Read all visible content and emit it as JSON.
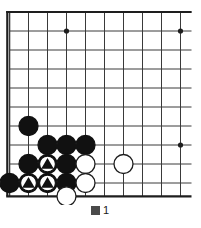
{
  "figure": {
    "caption": "圖 1",
    "caption_number": "1",
    "type": "go-board-diagram"
  },
  "board": {
    "columns": 10,
    "rows": 10,
    "grid_spacing": 19,
    "origin_x": 9.5,
    "origin_y": 12,
    "line_color": "#3a3a3a",
    "edge_color": "#1e1e1e",
    "background": "#ffffff",
    "edges": {
      "left": true,
      "top": true,
      "bottom": true,
      "right": false
    },
    "star_points": [
      {
        "col": 3,
        "row": 1
      },
      {
        "col": 9,
        "row": 1
      },
      {
        "col": 9,
        "row": 7
      }
    ],
    "stone_radius": 9.5,
    "colors": {
      "black_stone": "#111111",
      "white_stone": "#ffffff",
      "white_stone_border": "#1e1e1e",
      "mark_triangle": "#111111",
      "mark_disc": "#ffffff"
    }
  },
  "stones": [
    {
      "id": "b1",
      "color": "black",
      "col": 1,
      "row": 6,
      "mark": "none"
    },
    {
      "id": "b2",
      "color": "black",
      "col": 2,
      "row": 7,
      "mark": "none"
    },
    {
      "id": "b3",
      "color": "black",
      "col": 3,
      "row": 7,
      "mark": "none"
    },
    {
      "id": "b4",
      "color": "black",
      "col": 4,
      "row": 7,
      "mark": "none"
    },
    {
      "id": "b5",
      "color": "black",
      "col": 1,
      "row": 8,
      "mark": "none"
    },
    {
      "id": "b6",
      "color": "black",
      "col": 2,
      "row": 8,
      "mark": "triangle"
    },
    {
      "id": "b7",
      "color": "black",
      "col": 3,
      "row": 8,
      "mark": "none"
    },
    {
      "id": "b8",
      "color": "black",
      "col": 0,
      "row": 9,
      "mark": "none"
    },
    {
      "id": "b9",
      "color": "black",
      "col": 1,
      "row": 9,
      "mark": "triangle"
    },
    {
      "id": "b10",
      "color": "black",
      "col": 2,
      "row": 9,
      "mark": "triangle"
    },
    {
      "id": "b11",
      "color": "black",
      "col": 3,
      "row": 9,
      "mark": "none"
    },
    {
      "id": "w1",
      "color": "white",
      "col": 4,
      "row": 8,
      "mark": "none"
    },
    {
      "id": "w2",
      "color": "white",
      "col": 6,
      "row": 8,
      "mark": "none"
    },
    {
      "id": "w3",
      "color": "white",
      "col": 4,
      "row": 9,
      "mark": "none"
    },
    {
      "id": "w4",
      "color": "white",
      "col": 3,
      "row": 10,
      "mark": "none"
    }
  ],
  "chart_data": {
    "type": "diagram",
    "black_stones": 11,
    "white_stones": 4,
    "marked_black_stones": 3
  }
}
